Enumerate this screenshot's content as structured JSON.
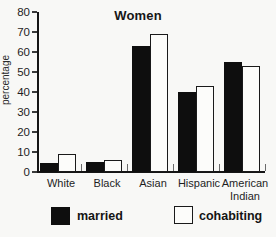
{
  "figure": {
    "background": "#f8f8f6"
  },
  "chart_data": {
    "type": "bar",
    "title": "Women",
    "xlabel": "",
    "ylabel": "percentage",
    "categories": [
      "White",
      "Black",
      "Asian",
      "Hispanic",
      "American Indian"
    ],
    "series": [
      {
        "name": "married",
        "style": "filled",
        "color": "#0e0e0e",
        "values": [
          4.5,
          5,
          63,
          40,
          55
        ]
      },
      {
        "name": "cohabiting",
        "style": "open",
        "color": "#ffffff",
        "values": [
          9,
          6,
          69,
          43,
          53
        ]
      }
    ],
    "ylim": [
      0,
      80
    ],
    "yticks": [
      0,
      10,
      20,
      30,
      40,
      50,
      60,
      70,
      80
    ],
    "grid": false,
    "legend_position": "bottom"
  }
}
